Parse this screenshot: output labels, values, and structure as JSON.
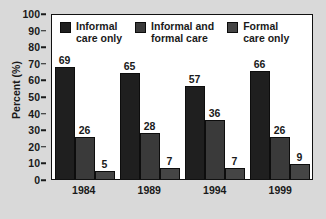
{
  "chart_data": {
    "type": "bar",
    "title": "",
    "xlabel": "",
    "ylabel": "Percent (%)",
    "categories": [
      "1984",
      "1989",
      "1994",
      "1999"
    ],
    "ylim": [
      0,
      100
    ],
    "yticks": [
      0,
      10,
      20,
      30,
      40,
      50,
      60,
      70,
      80,
      90,
      100
    ],
    "ytick_labels": [
      "0",
      "10",
      "20",
      "30",
      "40",
      "50",
      "60",
      "70",
      "80",
      "90",
      "100"
    ],
    "grid": false,
    "legend_position": "top-inside",
    "series": [
      {
        "name": "Informal\ncare only",
        "color": "#1f1f1f",
        "values": [
          69,
          65,
          57,
          66
        ],
        "labels": [
          "69",
          "65",
          "57",
          "66"
        ]
      },
      {
        "name": "Informal and\nformal care",
        "color": "#3a3a3a",
        "values": [
          26,
          28,
          36,
          26
        ],
        "labels": [
          "26",
          "28",
          "36",
          "26"
        ]
      },
      {
        "name": "Formal\ncare only",
        "color": "#454545",
        "values": [
          5,
          7,
          7,
          9
        ],
        "labels": [
          "5",
          "7",
          "7",
          "9"
        ]
      }
    ]
  },
  "figure": {
    "background_color": "#d9d9d9",
    "plot_background_color": "#ffffff",
    "axis_color": "#111111"
  }
}
